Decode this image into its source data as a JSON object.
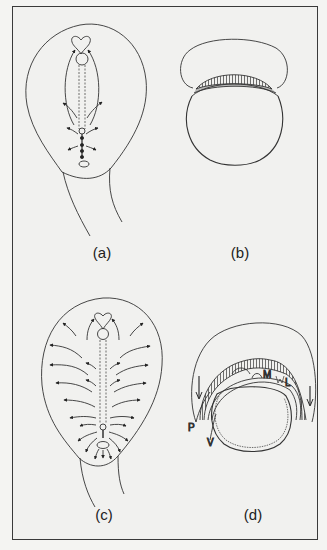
{
  "figure": {
    "panels": [
      {
        "id": "a",
        "label": "(a)",
        "description": "Embryo outline with heart, notochord and short arrows near primitive streak"
      },
      {
        "id": "b",
        "label": "(b)",
        "description": "Cross-section: dome over striated band on yolk sphere"
      },
      {
        "id": "c",
        "label": "(c)",
        "description": "Embryo outline with many outward-flow arrows along notochord"
      },
      {
        "id": "d",
        "label": "(d)",
        "description": "Cross-section with layered tissues and labelled regions"
      }
    ],
    "annotations_d": {
      "M": "M",
      "L": "L",
      "P": "P",
      "V": "V"
    },
    "colors": {
      "line": "#333333",
      "background": "#f1f1ef",
      "frame": "#3a3a3a"
    }
  }
}
